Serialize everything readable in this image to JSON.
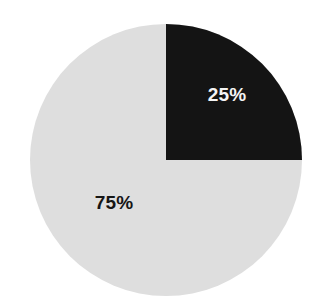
{
  "canvas": {
    "width": 317,
    "height": 308,
    "background": "#ffffff"
  },
  "chart_data": {
    "type": "pie",
    "title": "",
    "subtitle": "",
    "xlabel": "",
    "ylabel": "",
    "legend": "none",
    "grid": false,
    "labels_inside": true,
    "start_angle_deg": 0,
    "direction": "clockwise",
    "categories": [
      "25%",
      "75%"
    ],
    "values": [
      25,
      75
    ],
    "total": 100,
    "units": "percent",
    "slices": [
      {
        "name": "dark-slice",
        "label": "25%",
        "value": 25,
        "color": "#141414",
        "label_color": "#f4f4f4",
        "start_angle_deg": 0,
        "end_angle_deg": 90,
        "label_center": {
          "x": 227,
          "y": 94
        }
      },
      {
        "name": "light-slice",
        "label": "75%",
        "value": 75,
        "color": "#dedede",
        "label_color": "#151515",
        "start_angle_deg": 90,
        "end_angle_deg": 360,
        "label_center": {
          "x": 114,
          "y": 202
        }
      }
    ],
    "geometry": {
      "center_x": 166,
      "center_y": 160,
      "radius": 136
    }
  }
}
